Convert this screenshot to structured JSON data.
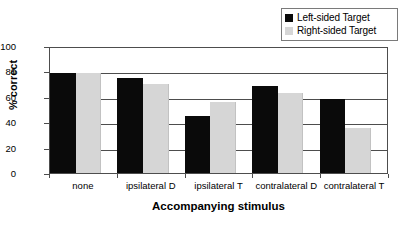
{
  "chart_data": {
    "type": "bar",
    "title": "",
    "subtitle": "",
    "xlabel": "Accompanying stimulus",
    "ylabel": "% correct",
    "categories": [
      "none",
      "ipsilateral D",
      "ipsilateral T",
      "contralateral D",
      "contralateral T"
    ],
    "series": [
      {
        "name": "Left-sided Target",
        "color": "#0a0a0a",
        "values": [
          80,
          76,
          46,
          70,
          59
        ]
      },
      {
        "name": "Right-sided Target",
        "color": "#d6d6d6",
        "values": [
          80,
          71,
          57,
          64,
          36
        ]
      }
    ],
    "ylim": [
      0,
      100
    ],
    "ytick_labels": [
      "0",
      "20",
      "40",
      "60",
      "80",
      "100"
    ],
    "ytick_values": [
      0,
      20,
      40,
      60,
      80,
      100
    ],
    "grid": "horizontal",
    "legend_position": "top-right",
    "bar_group_mode": "grouped"
  },
  "legend": {
    "entries": [
      {
        "label": "Left-sided Target",
        "swatch": "#0a0a0a"
      },
      {
        "label": "Right-sided Target",
        "swatch": "#d6d6d6"
      }
    ]
  },
  "axes": {
    "y": {
      "label": "% correct",
      "ticks": [
        "0",
        "20",
        "40",
        "60",
        "80",
        "100"
      ]
    },
    "x": {
      "label": "Accompanying stimulus",
      "ticks": [
        "none",
        "ipsilateral D",
        "ipsilateral T",
        "contralateral D",
        "contralateral T"
      ]
    }
  }
}
